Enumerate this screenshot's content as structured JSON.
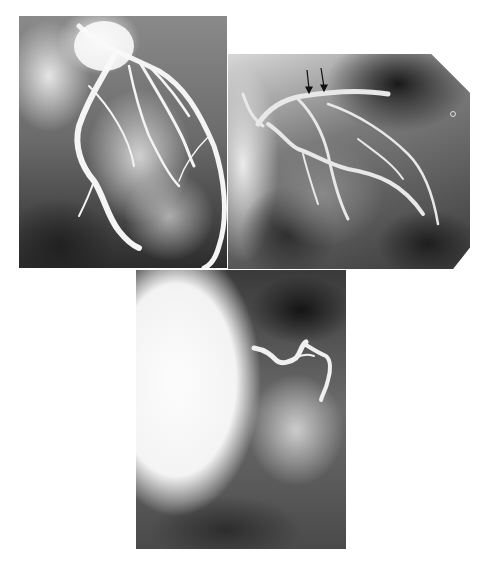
{
  "figure": {
    "background_color": "#ffffff",
    "panels": [
      {
        "id": "panel-a",
        "description": "Coronary angiogram, left coronary system with tortuous branches",
        "position": "top-left"
      },
      {
        "id": "panel-b",
        "description": "Coronary angiogram with two arrows marking a lesion near vessel origin",
        "position": "top-right",
        "annotations": [
          {
            "type": "arrow",
            "count": 2,
            "direction": "down"
          }
        ]
      },
      {
        "id": "panel-c",
        "description": "Coronary angiogram showing a short tortuous contrast-filled vessel",
        "position": "bottom-center"
      }
    ]
  }
}
